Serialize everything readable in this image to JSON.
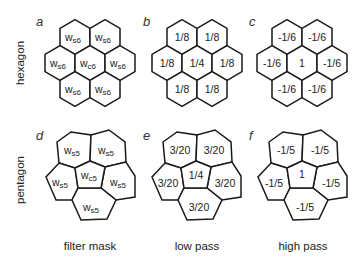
{
  "rows": [
    {
      "label": "hexagon"
    },
    {
      "label": "pentagon"
    }
  ],
  "columns": [
    {
      "label": "filter mask"
    },
    {
      "label": "low pass"
    },
    {
      "label": "high pass"
    }
  ],
  "panels": {
    "a": {
      "letter": "a",
      "cells": [
        {
          "main": "w",
          "sub": "s6"
        },
        {
          "main": "w",
          "sub": "s6"
        },
        {
          "main": "w",
          "sub": "s6"
        },
        {
          "main": "w",
          "sub": "c6"
        },
        {
          "main": "w",
          "sub": "s6"
        },
        {
          "main": "w",
          "sub": "s6"
        },
        {
          "main": "w",
          "sub": "s6"
        }
      ]
    },
    "b": {
      "letter": "b",
      "cells": [
        {
          "main": "1/8"
        },
        {
          "main": "1/8"
        },
        {
          "main": "1/8"
        },
        {
          "main": "1/4"
        },
        {
          "main": "1/8"
        },
        {
          "main": "1/8"
        },
        {
          "main": "1/8"
        }
      ]
    },
    "c": {
      "letter": "c",
      "cells": [
        {
          "main": "-1/6"
        },
        {
          "main": "-1/6"
        },
        {
          "main": "-1/6"
        },
        {
          "main": "1"
        },
        {
          "main": "-1/6"
        },
        {
          "main": "-1/6"
        },
        {
          "main": "-1/6"
        }
      ]
    },
    "d": {
      "letter": "d",
      "cells": [
        {
          "main": "w",
          "sub": "s5"
        },
        {
          "main": "w",
          "sub": "s5"
        },
        {
          "main": "w",
          "sub": "s5"
        },
        {
          "main": "w",
          "sub": "c5"
        },
        {
          "main": "w",
          "sub": "s5"
        },
        {
          "main": "w",
          "sub": "s5"
        }
      ]
    },
    "e": {
      "letter": "e",
      "cells": [
        {
          "main": "3/20"
        },
        {
          "main": "3/20"
        },
        {
          "main": "3/20"
        },
        {
          "main": "1/4"
        },
        {
          "main": "3/20"
        },
        {
          "main": "3/20"
        }
      ]
    },
    "f": {
      "letter": "f",
      "cells": [
        {
          "main": "-1/5"
        },
        {
          "main": "-1/5"
        },
        {
          "main": "-1/5"
        },
        {
          "main": "1"
        },
        {
          "main": "-1/5"
        },
        {
          "main": "-1/5"
        }
      ]
    }
  }
}
